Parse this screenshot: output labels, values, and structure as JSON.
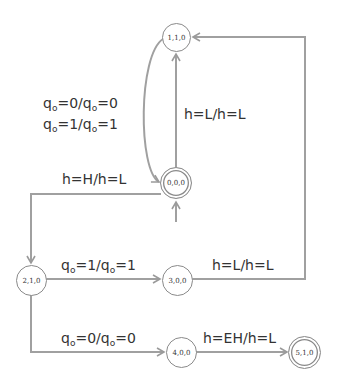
{
  "diagram": {
    "type": "state-machine",
    "colors": {
      "edge": "#9a9a9a",
      "node_border": "#8a8a8a",
      "text": "#333333"
    },
    "nodes": [
      {
        "id": "n110",
        "label": "1,1,0",
        "final": false
      },
      {
        "id": "n000",
        "label": "0,0,0",
        "final": true,
        "initial": true
      },
      {
        "id": "n210",
        "label": "2,1,0",
        "final": false
      },
      {
        "id": "n300",
        "label": "3,0,0",
        "final": false
      },
      {
        "id": "n400",
        "label": "4,0,0",
        "final": false
      },
      {
        "id": "n510",
        "label": "5,1,0",
        "final": true
      }
    ],
    "edges": [
      {
        "from": "0,0,0",
        "to": "1,1,0",
        "label": "h=L/h=L"
      },
      {
        "from": "1,1,0",
        "to": "0,0,0",
        "label_lines": [
          "qo=0/qo=0",
          "qo=1/qo=1"
        ]
      },
      {
        "from": "0,0,0",
        "to": "2,1,0",
        "label": "h=H/h=L"
      },
      {
        "from": "2,1,0",
        "to": "3,0,0",
        "label": "qo=1/qo=1"
      },
      {
        "from": "3,0,0",
        "to": "1,1,0",
        "label": "h=L/h=L"
      },
      {
        "from": "2,1,0",
        "to": "4,0,0",
        "label": "qo=0/qo=0"
      },
      {
        "from": "4,0,0",
        "to": "5,1,0",
        "label": "h=EH/h=L"
      }
    ],
    "labels": {
      "e_000_110": "h=L/h=L",
      "e_110_000_l1_q1": "q",
      "e_110_000_l1_s1": "o",
      "e_110_000_l1_m": "=0/q",
      "e_110_000_l1_s2": "o",
      "e_110_000_l1_e": "=0",
      "e_110_000_l2_q1": "q",
      "e_110_000_l2_s1": "o",
      "e_110_000_l2_m": "=1/q",
      "e_110_000_l2_s2": "o",
      "e_110_000_l2_e": "=1",
      "e_000_210": "h=H/h=L",
      "e_210_300_q1": "q",
      "e_210_300_s1": "o",
      "e_210_300_m": "=1/q",
      "e_210_300_s2": "o",
      "e_210_300_e": "=1",
      "e_300_110": "h=L/h=L",
      "e_210_400_q1": "q",
      "e_210_400_s1": "o",
      "e_210_400_m": "=0/q",
      "e_210_400_s2": "o",
      "e_210_400_e": "=0",
      "e_400_510": "h=EH/h=L"
    }
  }
}
